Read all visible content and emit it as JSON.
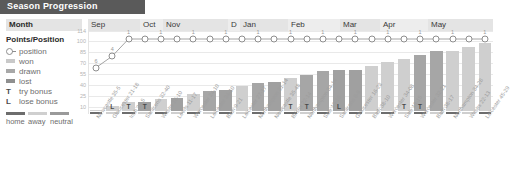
{
  "title": "Season Progression",
  "header": {
    "row_label": "Month",
    "months": [
      "Sep",
      "Oct",
      "Nov",
      "D",
      "Jan",
      "Feb",
      "Mar",
      "Apr",
      "May"
    ]
  },
  "legend": {
    "heading": "Points/Position",
    "items": [
      {
        "key": "position-marker",
        "label": "position",
        "color": "#8e8e8e"
      },
      {
        "key": "won-swatch",
        "label": "won",
        "color": "#c9c9c9"
      },
      {
        "key": "drawn-swatch",
        "label": "drawn",
        "color": "#a8a8a8"
      },
      {
        "key": "lost-swatch",
        "label": "lost",
        "color": "#8f8f8f"
      },
      {
        "key": "try-bonus-letter",
        "label": "try bonus",
        "glyph": "T"
      },
      {
        "key": "lose-bonus-letter",
        "label": "lose bonus",
        "glyph": "L"
      }
    ]
  },
  "venue_key": {
    "items": [
      {
        "label": "home",
        "color": "#6d6d6d"
      },
      {
        "label": "away",
        "color": "#cfcfcf"
      },
      {
        "label": "neutral",
        "color": "#9a9a9a"
      }
    ]
  },
  "chart_data": {
    "type": "bar",
    "title": "Season Progression",
    "xlabel": "",
    "ylabel": "Points",
    "ylim": [
      0,
      114
    ],
    "yticks": [
      114,
      100,
      85,
      70,
      55,
      40,
      25,
      10
    ],
    "grid": true,
    "legend_position": "left",
    "categories": [
      "Newcastle 35-5",
      "Gloucester 21-18",
      "Irish 29-5",
      "Saracens 32-40",
      "Wasps 16-10",
      "Leeds 11-17",
      "Worcester 24-10",
      "Leicester 24-10",
      "Bath 9-21",
      "Leicester 27-17",
      "Northampton 31-14",
      "Newcastle 35-48",
      "Bristol 22-14",
      "Northampton 34-14",
      "Sale 19-16",
      "Saracens 8-9",
      "Gloucester 16-23",
      "Bath 38-10",
      "Worcester 34-08",
      "Sale 18-15",
      "Worcester 32-21",
      "Bath 38-17",
      "Northampton 34-28",
      "Wasps 22-13",
      "Leicester 45-29"
    ],
    "values": [
      6,
      11,
      16,
      16,
      21,
      22,
      27,
      32,
      33,
      38,
      43,
      44,
      49,
      54,
      59,
      60,
      61,
      66,
      71,
      76,
      81,
      86,
      87,
      92,
      97
    ],
    "venues": [
      "home",
      "away",
      "home",
      "away",
      "home",
      "away",
      "home",
      "away",
      "home",
      "away",
      "home",
      "away",
      "home",
      "away",
      "home",
      "away",
      "home",
      "away",
      "home",
      "away",
      "home",
      "away",
      "home",
      "away",
      "home"
    ],
    "results": [
      "won",
      "won",
      "won",
      "lost",
      "won",
      "lost",
      "won",
      "won",
      "lost",
      "won",
      "won",
      "lost",
      "won",
      "won",
      "won",
      "lost",
      "lost",
      "won",
      "won",
      "won",
      "won",
      "won",
      "won",
      "won",
      "won"
    ],
    "bonuses": [
      "",
      "L",
      "T",
      "T",
      "",
      "",
      "",
      "",
      "",
      "",
      "",
      "",
      "T",
      "T",
      "",
      "L",
      "",
      "",
      "",
      "T",
      "T",
      "",
      "",
      "",
      ""
    ],
    "series": [
      {
        "name": "position",
        "type": "line",
        "values": [
          6,
          4,
          1,
          1,
          1,
          1,
          1,
          1,
          1,
          1,
          1,
          1,
          1,
          1,
          1,
          1,
          1,
          1,
          1,
          1,
          1,
          1,
          1,
          1,
          1
        ],
        "point_labels": [
          "6",
          "4",
          "1",
          "",
          "1",
          "",
          "1",
          "",
          "1",
          "",
          "1",
          "",
          "1",
          "",
          "1",
          "",
          "1",
          "",
          "1",
          "",
          "1",
          "",
          "1",
          "",
          "1"
        ]
      }
    ]
  }
}
